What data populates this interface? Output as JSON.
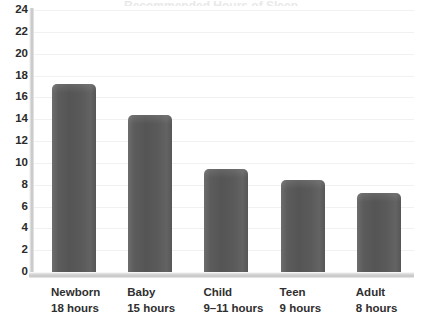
{
  "chart_data": {
    "type": "bar",
    "title": "",
    "xlabel": "",
    "ylabel": "",
    "ylim": [
      0,
      24
    ],
    "ytick_step": 2,
    "grid": true,
    "legend": "none",
    "orientation": "vertical",
    "bar_color": "#5a5a5a",
    "background_color": "#ffffff",
    "axis_color": "#c9c9c9",
    "gridline_color": "#f0f1f3",
    "label_color": "#2b2b2b",
    "categories": [
      "Newborn",
      "Baby",
      "Child",
      "Teen",
      "Adult"
    ],
    "category_sublabels": [
      "18 hours",
      "15 hours",
      "9–11 hours",
      "9 hours",
      "8 hours"
    ],
    "values": [
      17.2,
      14.4,
      9.4,
      8.4,
      7.2
    ],
    "yticks": [
      0,
      2,
      4,
      6,
      8,
      10,
      12,
      14,
      16,
      18,
      20,
      22,
      24
    ],
    "ytick_labels": [
      "0",
      "2",
      "4",
      "6",
      "8",
      "10",
      "12",
      "14",
      "16",
      "18",
      "20",
      "22",
      "24"
    ]
  },
  "title_remnant": "Recommended Hours of Sleep"
}
